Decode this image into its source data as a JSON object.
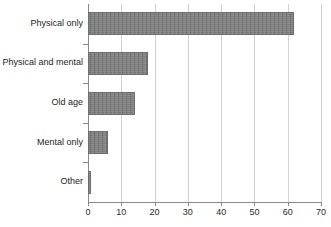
{
  "chart_data": {
    "type": "bar",
    "orientation": "horizontal",
    "title": "",
    "subtitle": "",
    "xlabel": "",
    "ylabel": "",
    "categories": [
      "Physical only",
      "Physical and mental",
      "Old age",
      "Mental only",
      "Other"
    ],
    "values": [
      62,
      18,
      14,
      6,
      1
    ],
    "xlim": [
      0,
      70
    ],
    "xticks": [
      0,
      10,
      20,
      30,
      40,
      50,
      60,
      70
    ],
    "xtick_labels": [
      "0",
      "10",
      "20",
      "30",
      "40",
      "50",
      "60",
      "70"
    ],
    "grid": true,
    "grid_axis": "x",
    "legend": false,
    "legend_entries": [],
    "annotations": [],
    "series": [
      {
        "name": "",
        "values": [
          62,
          18,
          14,
          6,
          1
        ]
      }
    ],
    "colors": {
      "bar_fill": "#7c7c7c",
      "bar_border": "#6d6d6d",
      "gridline": "#d2d2d2",
      "axis_line": "#8a8a8a",
      "label_text": "#1d1d1d",
      "tick_text": "#2b2b2b",
      "background": "#ffffff"
    }
  }
}
